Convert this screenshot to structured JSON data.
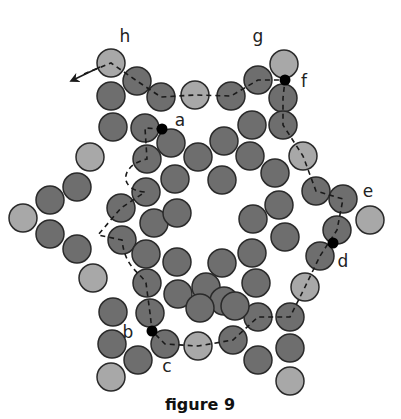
{
  "caption": "figure 9",
  "colors": {
    "dark_bead": "#6e6e6e",
    "light_bead": "#a8a8a8",
    "bead_stroke": "#2a2a2a",
    "thread": "#1a1a1a",
    "knot": "#000000"
  },
  "bead_radius": 14,
  "labels": [
    {
      "text": "h",
      "x": 125,
      "y": 42
    },
    {
      "text": "g",
      "x": 258,
      "y": 42
    },
    {
      "text": "f",
      "x": 304,
      "y": 87
    },
    {
      "text": "a",
      "x": 180,
      "y": 126
    },
    {
      "text": "e",
      "x": 368,
      "y": 197
    },
    {
      "text": "d",
      "x": 343,
      "y": 267
    },
    {
      "text": "b",
      "x": 128,
      "y": 338
    },
    {
      "text": "c",
      "x": 167,
      "y": 372
    }
  ],
  "beads": [
    {
      "x": 111,
      "y": 63,
      "t": "light"
    },
    {
      "x": 137,
      "y": 81,
      "t": "dark"
    },
    {
      "x": 161,
      "y": 97,
      "t": "dark"
    },
    {
      "x": 195,
      "y": 95,
      "t": "light"
    },
    {
      "x": 231,
      "y": 96,
      "t": "dark"
    },
    {
      "x": 258,
      "y": 80,
      "t": "dark"
    },
    {
      "x": 284,
      "y": 64,
      "t": "light"
    },
    {
      "x": 111,
      "y": 96,
      "t": "dark"
    },
    {
      "x": 113,
      "y": 127,
      "t": "dark"
    },
    {
      "x": 145,
      "y": 128,
      "t": "dark"
    },
    {
      "x": 171,
      "y": 143,
      "t": "dark"
    },
    {
      "x": 90,
      "y": 157,
      "t": "light"
    },
    {
      "x": 147,
      "y": 159,
      "t": "dark"
    },
    {
      "x": 283,
      "y": 98,
      "t": "dark"
    },
    {
      "x": 283,
      "y": 125,
      "t": "dark"
    },
    {
      "x": 252,
      "y": 125,
      "t": "dark"
    },
    {
      "x": 224,
      "y": 141,
      "t": "dark"
    },
    {
      "x": 198,
      "y": 157,
      "t": "dark"
    },
    {
      "x": 250,
      "y": 156,
      "t": "dark"
    },
    {
      "x": 175,
      "y": 179,
      "t": "dark"
    },
    {
      "x": 222,
      "y": 180,
      "t": "dark"
    },
    {
      "x": 303,
      "y": 156,
      "t": "light"
    },
    {
      "x": 275,
      "y": 173,
      "t": "dark"
    },
    {
      "x": 316,
      "y": 191,
      "t": "dark"
    },
    {
      "x": 343,
      "y": 199,
      "t": "dark"
    },
    {
      "x": 370,
      "y": 220,
      "t": "light"
    },
    {
      "x": 337,
      "y": 230,
      "t": "dark"
    },
    {
      "x": 320,
      "y": 256,
      "t": "dark"
    },
    {
      "x": 305,
      "y": 287,
      "t": "light"
    },
    {
      "x": 279,
      "y": 205,
      "t": "dark"
    },
    {
      "x": 253,
      "y": 219,
      "t": "dark"
    },
    {
      "x": 285,
      "y": 237,
      "t": "dark"
    },
    {
      "x": 252,
      "y": 253,
      "t": "dark"
    },
    {
      "x": 222,
      "y": 263,
      "t": "dark"
    },
    {
      "x": 256,
      "y": 283,
      "t": "dark"
    },
    {
      "x": 23,
      "y": 218,
      "t": "light"
    },
    {
      "x": 50,
      "y": 200,
      "t": "dark"
    },
    {
      "x": 50,
      "y": 234,
      "t": "dark"
    },
    {
      "x": 77,
      "y": 187,
      "t": "dark"
    },
    {
      "x": 77,
      "y": 249,
      "t": "dark"
    },
    {
      "x": 93,
      "y": 278,
      "t": "light"
    },
    {
      "x": 121,
      "y": 208,
      "t": "dark"
    },
    {
      "x": 122,
      "y": 240,
      "t": "dark"
    },
    {
      "x": 146,
      "y": 192,
      "t": "dark"
    },
    {
      "x": 154,
      "y": 223,
      "t": "dark"
    },
    {
      "x": 146,
      "y": 254,
      "t": "dark"
    },
    {
      "x": 177,
      "y": 213,
      "t": "dark"
    },
    {
      "x": 177,
      "y": 262,
      "t": "dark"
    },
    {
      "x": 147,
      "y": 283,
      "t": "dark"
    },
    {
      "x": 178,
      "y": 294,
      "t": "dark"
    },
    {
      "x": 206,
      "y": 287,
      "t": "dark"
    },
    {
      "x": 224,
      "y": 301,
      "t": "dark"
    },
    {
      "x": 150,
      "y": 313,
      "t": "dark"
    },
    {
      "x": 113,
      "y": 312,
      "t": "dark"
    },
    {
      "x": 112,
      "y": 344,
      "t": "dark"
    },
    {
      "x": 138,
      "y": 360,
      "t": "dark"
    },
    {
      "x": 111,
      "y": 377,
      "t": "light"
    },
    {
      "x": 165,
      "y": 344,
      "t": "dark"
    },
    {
      "x": 198,
      "y": 346,
      "t": "light"
    },
    {
      "x": 233,
      "y": 340,
      "t": "dark"
    },
    {
      "x": 258,
      "y": 317,
      "t": "dark"
    },
    {
      "x": 290,
      "y": 317,
      "t": "dark"
    },
    {
      "x": 258,
      "y": 360,
      "t": "dark"
    },
    {
      "x": 290,
      "y": 348,
      "t": "dark"
    },
    {
      "x": 290,
      "y": 381,
      "t": "light"
    },
    {
      "x": 200,
      "y": 308,
      "t": "dark"
    },
    {
      "x": 235,
      "y": 306,
      "t": "dark"
    }
  ],
  "knots": [
    {
      "x": 162,
      "y": 129,
      "label": "a"
    },
    {
      "x": 285,
      "y": 80,
      "label": "f"
    },
    {
      "x": 333,
      "y": 243,
      "label": "d"
    },
    {
      "x": 152,
      "y": 331,
      "label": "b"
    }
  ],
  "thread_path": "M 84 74 L 111 63 L 137 81 L 161 97 L 195 95 L 231 96 L 258 80 L 285 80 L 283 98 L 283 125 L 303 156 L 316 191 L 343 199 L 337 230 L 320 256 L 305 287 L 290 317 L 258 317 L 233 340 L 198 346 L 165 344 L 152 331 L 150 313 L 146 283 C 140 272, 125 268, 122 240 L 98 235 L 121 208 L 145 192 C 118 190, 120 165, 147 159 L 145 128 L 162 129",
  "arrow": {
    "x1": 100,
    "y1": 67,
    "x2": 73,
    "y2": 80
  }
}
